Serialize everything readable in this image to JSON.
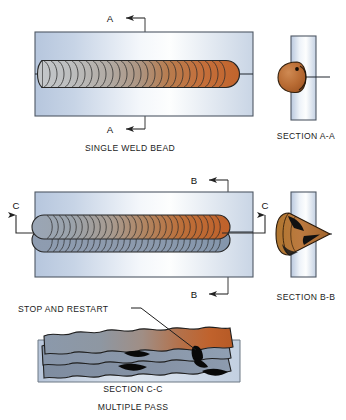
{
  "figure": {
    "background": "#ffffff"
  },
  "palette": {
    "plate_light": "#fdfdfe",
    "plate_blue": "#aabdd8",
    "plate_edge": "#5b6470",
    "bead_cool": "#b9bcc0",
    "bead_mid": "#a79a90",
    "bead_hot": "#c96a33",
    "bead_hot_deep": "#b4551f",
    "bead_blue_gray": "#8494ac",
    "bead_outline": "#2b2b2b",
    "defect_black": "#0d0d0d",
    "line": "#2a2a2a",
    "text": "#1a1a1a"
  },
  "views": {
    "single": {
      "caption": "SINGLE WELD BEAD",
      "section_label_top": "A",
      "section_label_bottom": "A",
      "ripple_count": 26
    },
    "section_aa": {
      "caption": "SECTION A-A"
    },
    "multiple": {
      "section_label_top": "B",
      "section_label_bottom": "B",
      "section_label_left": "C",
      "section_label_right": "C",
      "ripple_count": 30
    },
    "section_bb": {
      "caption": "SECTION B-B"
    },
    "section_cc": {
      "caption": "SECTION C-C",
      "subcaption": "MULTIPLE PASS",
      "annotation": "STOP AND RESTART",
      "pass_count": 3
    }
  }
}
